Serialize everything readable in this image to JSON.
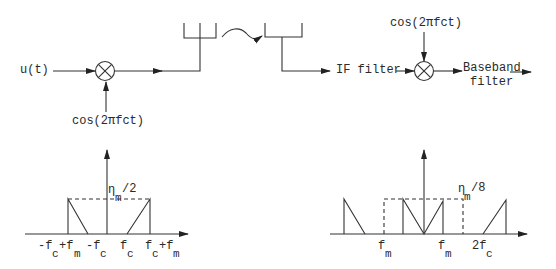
{
  "transmitter": {
    "input_label": "u(t)",
    "carrier_label": "cos(2πfct)",
    "mixer_icon": "multiplier-circle-x",
    "tx_antenna_icon": "antenna-fork",
    "channel_icon": "wave-arrow"
  },
  "receiver": {
    "rx_antenna_icon": "antenna-fork",
    "if_filter_label": "IF filter",
    "carrier_label": "cos(2πfct)",
    "mixer_icon": "multiplier-circle-x",
    "baseband_label_line1": "Baseband",
    "baseband_label_line2": "filter"
  },
  "spectrum_left": {
    "amplitude_label_main": "η",
    "amplitude_label_sub": "m",
    "amplitude_label_rest": "/2",
    "ticks": [
      {
        "main": "-f",
        "sub": "c",
        "extra": "+f",
        "extra_sub": "m"
      },
      {
        "main": "-f",
        "sub": "c"
      },
      {
        "main": "f",
        "sub": "c"
      },
      {
        "main": "f",
        "sub": "c",
        "extra": "+f",
        "extra_sub": "m"
      }
    ]
  },
  "spectrum_right": {
    "amplitude_label_main": "η",
    "amplitude_label_sub": "m",
    "amplitude_label_rest": "/8",
    "ticks": [
      {
        "main": "f",
        "sub": "m"
      },
      {
        "main": "f",
        "sub": "m"
      },
      {
        "main": "2f",
        "sub": "c"
      }
    ]
  }
}
